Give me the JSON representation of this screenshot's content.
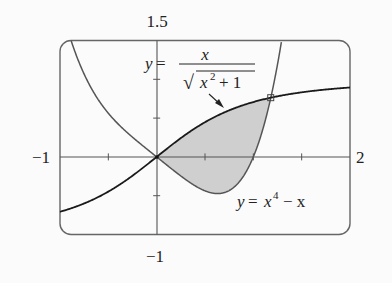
{
  "chart_data": {
    "type": "area",
    "title": "",
    "xlabel": "",
    "ylabel": "",
    "xlim": [
      -1,
      2
    ],
    "ylim": [
      -1,
      1.5
    ],
    "grid": false,
    "frame": "rounded",
    "axis_labels": {
      "y_top": "1.5",
      "y_bottom": "−1",
      "x_left": "−1",
      "x_right": "2"
    },
    "x_ticks": [
      -0.5,
      0.5,
      1,
      1.5
    ],
    "y_ticks": [
      -0.5,
      0.5,
      1
    ],
    "series": [
      {
        "name": "y = x/√(x²+1)",
        "function": "x / sqrt(x^2 + 1)",
        "x": [
          -1,
          -0.5,
          0,
          0.5,
          1,
          1.18,
          1.5,
          2
        ],
        "y": [
          -0.707,
          -0.447,
          0,
          0.447,
          0.707,
          0.763,
          0.832,
          0.894
        ],
        "color": "#1a1a1a"
      },
      {
        "name": "y = x⁴ − x",
        "function": "x^4 - x",
        "x": [
          -0.876,
          -0.5,
          0,
          0.5,
          0.63,
          1,
          1.18
        ],
        "y": [
          1.465,
          0.5625,
          0,
          -0.4375,
          -0.472,
          0,
          0.76
        ],
        "color": "#555555"
      }
    ],
    "shaded_region": {
      "between": [
        "x/sqrt(x^2+1)",
        "x^4 - x"
      ],
      "x_from": 0,
      "x_to": 1.18,
      "fill": "#cfcfcf"
    },
    "intersections": [
      {
        "x": 0,
        "y": 0
      },
      {
        "x": 1.18,
        "y": 0.763,
        "marker": "square"
      }
    ],
    "annotations": [
      {
        "text_prefix": "y =",
        "numerator": "x",
        "denominator_radicand": "x² + 1",
        "target": "upper curve",
        "arrow": true
      },
      {
        "text": "y = x⁴ − x",
        "target": "lower curve",
        "arrow": false
      }
    ]
  },
  "labels": {
    "y_top": "1.5",
    "y_bottom": "−1",
    "x_left": "−1",
    "x_right": "2",
    "upper_y": "y",
    "equals": "=",
    "upper_num": "x",
    "upper_den_x": "x",
    "upper_den_exp": "2",
    "upper_den_rest": "+ 1",
    "sqrt": "√",
    "lower_y": "y",
    "lower_eq": "=",
    "lower_x": "x",
    "lower_exp": "4",
    "lower_rest": "− x"
  }
}
